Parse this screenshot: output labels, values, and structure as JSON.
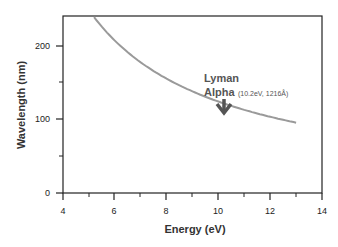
{
  "chart_data": {
    "type": "line",
    "title": "",
    "xlabel": "Energy  (eV)",
    "ylabel": "Wavelength  (nm)",
    "xlim": [
      4,
      14
    ],
    "ylim": [
      0,
      240
    ],
    "x_ticks": [
      "4",
      "6",
      "8",
      "10",
      "12",
      "14"
    ],
    "y_ticks": [
      "0",
      "100",
      "200"
    ],
    "grid": false,
    "legend": null,
    "series": [
      {
        "name": "wavelength = 1240/E",
        "x": [
          5.2,
          6,
          7,
          8,
          9,
          10,
          11,
          12,
          13
        ],
        "values": [
          238,
          207,
          177,
          155,
          138,
          124,
          113,
          103,
          95
        ]
      }
    ],
    "annotations": [
      {
        "text_main_line1": "Lyman",
        "text_main_line2": "Alpha",
        "text_detail": "(10.2eV,  1216Å)",
        "x": 10.2,
        "y": 121.6,
        "arrow": "down"
      }
    ]
  }
}
